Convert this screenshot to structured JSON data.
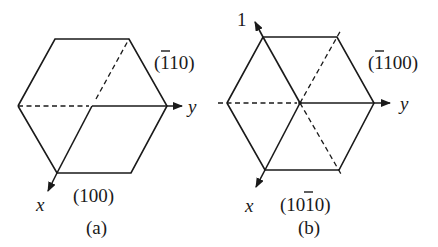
{
  "figure": {
    "panel_a": {
      "caption": "(a)",
      "plane_labels": {
        "upper_right": {
          "open": "(",
          "bar_digit": "1",
          "rest": "10)"
        },
        "bottom": "(100)"
      },
      "axes": {
        "x": "x",
        "y": "y"
      }
    },
    "panel_b": {
      "caption": "(b)",
      "plane_labels": {
        "upper_right": {
          "open": "(",
          "bar_digit": "1",
          "rest": "100)"
        },
        "bottom": {
          "pre": "(10",
          "bar_digit": "1",
          "post": "0)"
        }
      },
      "axes": {
        "x": "x",
        "y": "y",
        "third": "1"
      }
    }
  }
}
